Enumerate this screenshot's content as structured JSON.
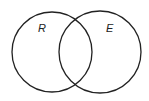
{
  "diagram": {
    "type": "venn",
    "sets": [
      {
        "label": "R",
        "cx": 52,
        "cy": 52,
        "r": 40
      },
      {
        "label": "E",
        "cx": 100,
        "cy": 52,
        "r": 41
      }
    ],
    "stroke_color": "#222222"
  }
}
